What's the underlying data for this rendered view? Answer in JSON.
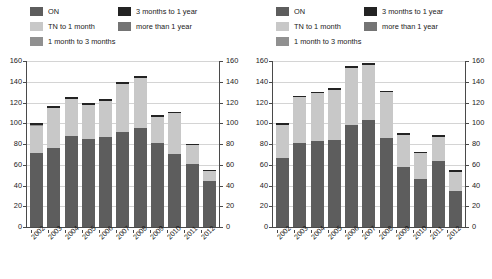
{
  "legend": {
    "items": [
      {
        "label": "ON",
        "color": "#5d5d5d"
      },
      {
        "label": "TN to 1 month",
        "color": "#c8c8c8"
      },
      {
        "label": "1 month to 3 months",
        "color": "#909090"
      },
      {
        "label": "3 months to 1 year",
        "color": "#232323"
      },
      {
        "label": "more than 1 year",
        "color": "#747474"
      }
    ]
  },
  "axis": {
    "ticks": [
      0,
      20,
      40,
      60,
      80,
      100,
      120,
      140,
      160
    ],
    "min": 0,
    "max": 160
  },
  "chart_data": [
    {
      "type": "bar",
      "title": "",
      "stacked": true,
      "panel": "left",
      "xlabel": "",
      "ylabel": "",
      "ylim": [
        0,
        160
      ],
      "yticks": [
        0,
        20,
        40,
        60,
        80,
        100,
        120,
        140,
        160
      ],
      "grid": true,
      "legend_position": "top",
      "categories": [
        "2002",
        "2003",
        "2004",
        "2005",
        "2006",
        "2007",
        "2008",
        "2009",
        "2010",
        "2011",
        "2012"
      ],
      "series": [
        {
          "name": "ON",
          "color": "#5d5d5d",
          "values": [
            71,
            76,
            88,
            85,
            87,
            92,
            95,
            81,
            70,
            61,
            44
          ]
        },
        {
          "name": "TN to 1 month",
          "color": "#c8c8c8",
          "values": [
            26,
            39,
            35,
            33,
            34,
            46,
            49,
            25,
            40,
            18,
            10
          ]
        },
        {
          "name": "1 month to 3 months",
          "color": "#909090",
          "values": [
            1,
            0,
            0,
            0,
            0,
            0,
            0,
            0,
            0,
            0,
            0
          ]
        },
        {
          "name": "3 months to 1 year",
          "color": "#232323",
          "values": [
            2,
            2,
            2,
            2,
            2,
            2,
            2,
            2,
            1,
            1,
            1
          ]
        },
        {
          "name": "more than 1 year",
          "color": "#747474",
          "values": [
            0,
            0,
            0,
            0,
            0,
            0,
            0,
            0,
            0,
            0,
            0
          ]
        }
      ],
      "totals": [
        100,
        117,
        125,
        120,
        123,
        140,
        146,
        108,
        111,
        80,
        55
      ]
    },
    {
      "type": "bar",
      "title": "",
      "stacked": true,
      "panel": "right",
      "xlabel": "",
      "ylabel": "",
      "ylim": [
        0,
        160
      ],
      "yticks": [
        0,
        20,
        40,
        60,
        80,
        100,
        120,
        140,
        160
      ],
      "grid": true,
      "legend_position": "top",
      "categories": [
        "2002",
        "2003",
        "2004",
        "2005",
        "2006",
        "2007",
        "2008",
        "2009",
        "2010",
        "2011",
        "2012"
      ],
      "series": [
        {
          "name": "ON",
          "color": "#5d5d5d",
          "values": [
            67,
            81,
            83,
            84,
            98,
            103,
            86,
            58,
            46,
            64,
            35
          ]
        },
        {
          "name": "TN to 1 month",
          "color": "#c8c8c8",
          "values": [
            31,
            44,
            46,
            48,
            55,
            53,
            44,
            31,
            25,
            23,
            18
          ]
        },
        {
          "name": "1 month to 3 months",
          "color": "#909090",
          "values": [
            0,
            0,
            0,
            0,
            0,
            0,
            0,
            0,
            0,
            0,
            0
          ]
        },
        {
          "name": "3 months to 1 year",
          "color": "#232323",
          "values": [
            2,
            1,
            1,
            2,
            2,
            2,
            1,
            2,
            1,
            2,
            2
          ]
        },
        {
          "name": "more than 1 year",
          "color": "#747474",
          "values": [
            0,
            0,
            0,
            0,
            0,
            0,
            0,
            0,
            0,
            0,
            0
          ]
        }
      ],
      "totals": [
        100,
        126,
        130,
        134,
        155,
        158,
        131,
        91,
        72,
        89,
        55
      ]
    }
  ]
}
